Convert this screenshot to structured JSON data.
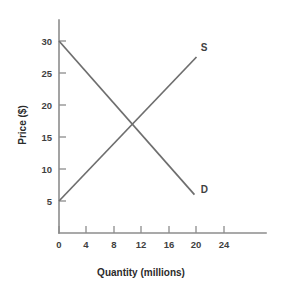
{
  "chart_data": {
    "type": "line",
    "title": "",
    "subtitle": "",
    "xlabel": "Quantity (millions)",
    "ylabel": "Price ($)",
    "xlim": [
      0,
      26
    ],
    "ylim": [
      0,
      32
    ],
    "xticks": [
      0,
      4,
      8,
      12,
      16,
      20,
      24
    ],
    "xtick_labels": [
      "0",
      "4",
      "8",
      "12",
      "16",
      "20",
      "24"
    ],
    "yticks": [
      5,
      10,
      15,
      20,
      25,
      30
    ],
    "ytick_labels": [
      "5",
      "10",
      "15",
      "20",
      "25",
      "30"
    ],
    "grid": false,
    "legend": "inline-end-labels",
    "line_color": "#6e6e6e",
    "axis_color": "#8c8c8c",
    "text_color": "#3f3f3f",
    "background": "#ffffff",
    "series": [
      {
        "name": "S",
        "label": "S",
        "description": "Supply curve, upward sloping",
        "x": [
          0,
          20
        ],
        "values": [
          5,
          27.5
        ],
        "label_x": 20.6,
        "label_y": 28.5
      },
      {
        "name": "D",
        "label": "D",
        "description": "Demand curve, downward sloping",
        "x": [
          0,
          19.7
        ],
        "values": [
          30,
          6
        ],
        "label_x": 20.6,
        "label_y": 6.3
      }
    ],
    "annotations": [
      {
        "name": "equilibrium",
        "x": 11.3,
        "y": 17.2,
        "text": ""
      }
    ]
  }
}
